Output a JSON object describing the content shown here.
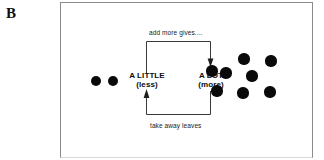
{
  "panel": {
    "letter": "B"
  },
  "figure": {
    "left_group": {
      "name": "a-little-dot-group",
      "count": 2,
      "dots": [
        {
          "cx": 35,
          "cy": 78,
          "r": 5.4
        },
        {
          "cx": 52,
          "cy": 78,
          "r": 5.4
        }
      ]
    },
    "right_group": {
      "name": "a-lot-dot-group",
      "count": 7,
      "dots": [
        {
          "cx": 183,
          "cy": 56,
          "r": 5.6
        },
        {
          "cx": 210,
          "cy": 58,
          "r": 5.6
        },
        {
          "cx": 165,
          "cy": 70,
          "r": 5.6
        },
        {
          "cx": 191,
          "cy": 73,
          "r": 5.6
        },
        {
          "cx": 151,
          "cy": 68,
          "r": 5.6
        },
        {
          "cx": 156,
          "cy": 88,
          "r": 5.6
        },
        {
          "cx": 182,
          "cy": 90,
          "r": 5.6
        },
        {
          "cx": 209,
          "cy": 89,
          "r": 5.6
        }
      ]
    },
    "labels": {
      "little_main": "A LITTLE",
      "little_sub": "(less)",
      "lot_main": "A LOT",
      "lot_sub": "(more)"
    },
    "arrows": {
      "top_caption": "add more gives....",
      "bottom_caption": "take away leaves",
      "top_direction": "left-to-right-down",
      "bottom_direction": "right-to-left-up"
    },
    "colors": {
      "dot": "#0a0a0a",
      "frame_border": "#8b8b8b",
      "arrow_stroke": "#3a3a3a",
      "text": "#111111",
      "background": "#ffffff"
    }
  }
}
